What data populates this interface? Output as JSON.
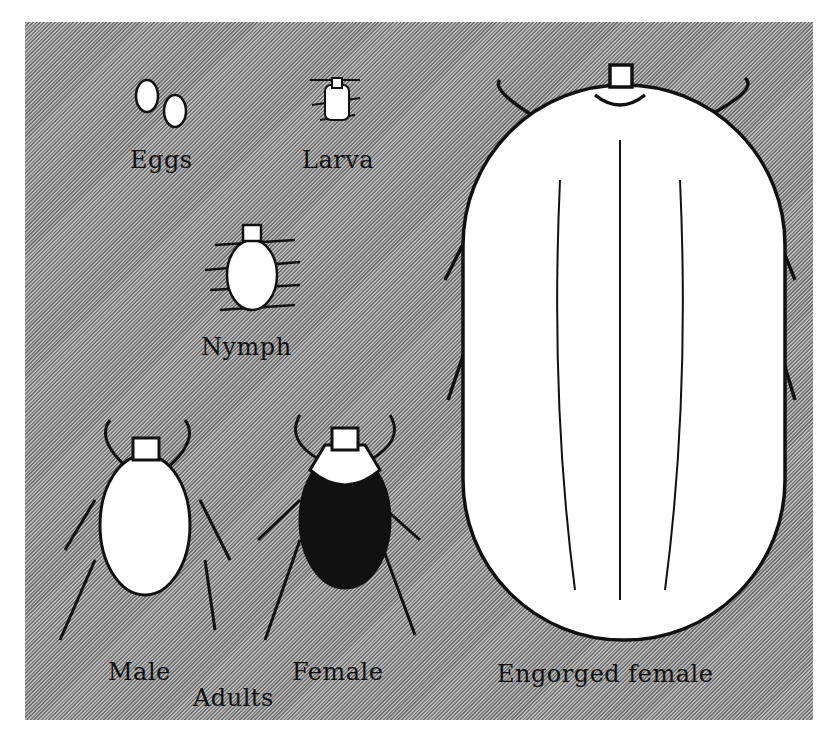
{
  "figure": {
    "labels": {
      "eggs": "Eggs",
      "larva": "Larva",
      "nymph": "Nymph",
      "male": "Male",
      "female": "Female",
      "adults": "Adults",
      "engorged": "Engorged female"
    },
    "colors": {
      "background_light": "#bdbdbd",
      "background_dark": "#6e6e6e",
      "ink": "#111111",
      "body": "#ffffff"
    }
  }
}
